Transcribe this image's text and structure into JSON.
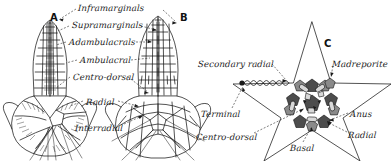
{
  "figure": {
    "background_color": "#ffffff",
    "ink_color": "#1a1a1a"
  },
  "panels": [
    {
      "id": "A",
      "letter": "A",
      "x": 50,
      "y": 12,
      "caption": "Dorsal view of arm and disc, plate mosaic"
    },
    {
      "id": "B",
      "letter": "B",
      "x": 180,
      "y": 12,
      "caption": "Dorsal view of arm and disc, alternate form"
    },
    {
      "id": "C",
      "letter": "C",
      "x": 324,
      "y": 38,
      "caption": "Aboral disc plate scheme, five-rayed"
    }
  ],
  "labels": [
    {
      "name": "inframarginals",
      "text": "Inframarginals",
      "x": 78,
      "y": 4,
      "align": "left"
    },
    {
      "name": "supramarginals",
      "text": "Supramarginals",
      "x": 72,
      "y": 21,
      "align": "left"
    },
    {
      "name": "adambulacrals",
      "text": "Adambulacrals",
      "x": 69,
      "y": 38,
      "align": "left"
    },
    {
      "name": "ambulacral",
      "text": "Ambulacral",
      "x": 80,
      "y": 56,
      "align": "left"
    },
    {
      "name": "centro-dorsal-a",
      "text": "Centro-dorsal",
      "x": 73,
      "y": 73,
      "align": "left"
    },
    {
      "name": "radial-a",
      "text": "Radial",
      "x": 86,
      "y": 98,
      "align": "left"
    },
    {
      "name": "interradial",
      "text": "Interradial",
      "x": 75,
      "y": 124,
      "align": "left"
    },
    {
      "name": "secondary-radial",
      "text": "Secondary radial",
      "x": 198,
      "y": 60,
      "align": "left"
    },
    {
      "name": "madreporite",
      "text": "Madreporite",
      "x": 332,
      "y": 60,
      "align": "left"
    },
    {
      "name": "terminal",
      "text": "Terminal",
      "x": 201,
      "y": 110,
      "align": "left"
    },
    {
      "name": "anus",
      "text": "Anus",
      "x": 350,
      "y": 110,
      "align": "left"
    },
    {
      "name": "centro-dorsal-c",
      "text": "Centro-dorsal",
      "x": 196,
      "y": 133,
      "align": "left"
    },
    {
      "name": "radial-c",
      "text": "Radial",
      "x": 348,
      "y": 131,
      "align": "left"
    },
    {
      "name": "basal",
      "text": "Basal",
      "x": 290,
      "y": 144,
      "align": "left"
    }
  ],
  "panel_c_elements": {
    "star_points": 5,
    "central_plate": "centro-dorsal",
    "ring_plates": [
      "radial",
      "basal"
    ],
    "special_plates": [
      "madreporite",
      "anus"
    ],
    "arm_tip_plate": "terminal",
    "coil_feature": "stone canal / spiral"
  }
}
